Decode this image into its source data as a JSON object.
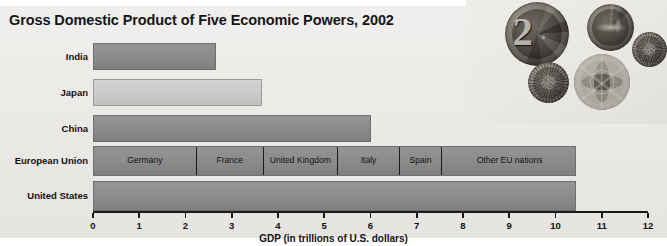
{
  "chart_data": {
    "type": "bar",
    "orientation": "horizontal",
    "title": "Gross Domestic Product of Five Economic Powers, 2002",
    "xlabel": "GDP (in trillions of U.S. dollars)",
    "ylabel": "",
    "xlim": [
      0,
      12
    ],
    "xticks": [
      "0",
      "1",
      "2",
      "3",
      "4",
      "5",
      "6",
      "7",
      "8",
      "9",
      "10",
      "11",
      "12"
    ],
    "grid": false,
    "legend": "none",
    "categories": [
      "India",
      "Japan",
      "China",
      "European Union",
      "United States"
    ],
    "values": [
      2.66,
      3.65,
      6.0,
      10.45,
      10.45
    ],
    "series": [
      {
        "name": "GDP (trillions of U.S. dollars)",
        "values": [
          2.66,
          3.65,
          6.0,
          10.45,
          10.45
        ]
      }
    ],
    "bars": [
      {
        "category": "India",
        "value": 2.66,
        "shade": "dark"
      },
      {
        "category": "Japan",
        "value": 3.65,
        "shade": "light"
      },
      {
        "category": "China",
        "value": 6.0,
        "shade": "dark"
      },
      {
        "category": "European Union",
        "value": 10.45,
        "shade": "dark",
        "stacked": true
      },
      {
        "category": "United States",
        "value": 10.45,
        "shade": "dark"
      }
    ],
    "eu_segments": [
      {
        "label": "Germany",
        "start": 0.0,
        "end": 2.2,
        "value": 2.2
      },
      {
        "label": "France",
        "start": 2.2,
        "end": 3.65,
        "value": 1.45
      },
      {
        "label": "United Kingdom",
        "start": 3.65,
        "end": 5.25,
        "value": 1.6
      },
      {
        "label": "Italy",
        "start": 5.25,
        "end": 6.6,
        "value": 1.35
      },
      {
        "label": "Spain",
        "start": 6.6,
        "end": 7.5,
        "value": 0.9
      },
      {
        "label": "Other EU nations",
        "start": 7.5,
        "end": 10.45,
        "value": 2.95
      }
    ],
    "colors": {
      "bar_dark": "#8b8b8b",
      "bar_light": "#cacaca",
      "bar_outline": "#6f6f6f",
      "segment_divider": "#1c1c1c",
      "axis": "#1a1a1a",
      "panel_background": "#eceae7",
      "text": "#121212"
    }
  },
  "photo": {
    "caption": "",
    "subject": "euro coins",
    "coins": [
      {
        "name": "two-euro-coin",
        "face": "2"
      },
      {
        "name": "bird-coin",
        "face": ""
      },
      {
        "name": "small-coin",
        "face": ""
      },
      {
        "name": "dark-textured-coin",
        "face": ""
      },
      {
        "name": "globe-coin",
        "face": ""
      }
    ]
  }
}
